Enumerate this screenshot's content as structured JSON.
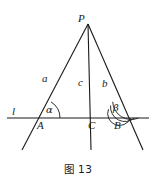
{
  "figure": {
    "caption": "图 13",
    "stroke_color": "#1a1a1a",
    "background_color": "#ffffff",
    "points": {
      "P": {
        "label": "P",
        "x": 88,
        "y": 24
      },
      "A": {
        "label": "A",
        "x": 41,
        "y": 118
      },
      "B": {
        "label": "B",
        "x": 120,
        "y": 118
      },
      "C": {
        "label": "C",
        "x": 90,
        "y": 118
      }
    },
    "point_labels": [
      {
        "name": "P",
        "text": "P",
        "x": 78,
        "y": 14
      },
      {
        "name": "A",
        "text": "A",
        "x": 37,
        "y": 120
      },
      {
        "name": "B",
        "text": "B",
        "x": 114,
        "y": 120
      },
      {
        "name": "C",
        "text": "C",
        "x": 88,
        "y": 120
      }
    ],
    "segment_labels": [
      {
        "name": "a",
        "text": "a",
        "x": 42,
        "y": 73
      },
      {
        "name": "c",
        "text": "c",
        "x": 78,
        "y": 77
      },
      {
        "name": "b",
        "text": "b",
        "x": 102,
        "y": 78
      }
    ],
    "angle_labels": [
      {
        "name": "alpha",
        "text": "α",
        "x": 46,
        "y": 105
      },
      {
        "name": "beta",
        "text": "β",
        "x": 113,
        "y": 103
      }
    ],
    "line_label": {
      "name": "l",
      "text": "l",
      "x": 12,
      "y": 106
    },
    "lines": {
      "transversal_l": {
        "x1": 7,
        "y1": 118,
        "x2": 149,
        "y2": 118
      },
      "ray_PA_extended": {
        "x1": 88,
        "y1": 24,
        "x2": 22,
        "y2": 150
      },
      "ray_PC_extended": {
        "x1": 88,
        "y1": 24,
        "x2": 91,
        "y2": 150
      },
      "ray_PB_extended": {
        "x1": 88,
        "y1": 24,
        "x2": 143,
        "y2": 150
      }
    },
    "angle_arcs": {
      "alpha_arc_count": 1,
      "beta_arc_count": 3
    }
  }
}
